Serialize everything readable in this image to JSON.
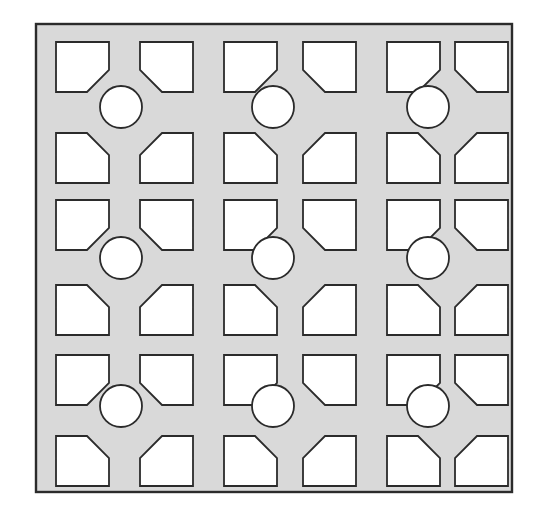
{
  "figure": {
    "name": "perforated-panel-pattern",
    "canvas": {
      "width": 548,
      "height": 516
    },
    "background_color": "#ffffff"
  },
  "panel": {
    "x": 36,
    "y": 24,
    "width": 476,
    "height": 468,
    "fill_color": "#d9d9d9",
    "stroke_color": "#2b2b2b",
    "stroke_width": 2.4
  },
  "holes": {
    "fill_color": "#ffffff",
    "stroke_color": "#2b2b2b",
    "stroke_width": 1.8,
    "square": {
      "count": 36,
      "rows": 6,
      "cols": 6,
      "width": 53,
      "height": 50,
      "chamfer": 22,
      "col_x": [
        56,
        140,
        224,
        303,
        387,
        455
      ],
      "row_y": [
        42,
        133,
        200,
        285,
        355,
        436
      ],
      "chamfer_map": [
        [
          "bottom-right",
          "bottom-left",
          "bottom-right",
          "bottom-left",
          "bottom-right",
          "bottom-left"
        ],
        [
          "top-right",
          "top-left",
          "top-right",
          "top-left",
          "top-right",
          "top-left"
        ],
        [
          "bottom-right",
          "bottom-left",
          "bottom-right",
          "bottom-left",
          "bottom-right",
          "bottom-left"
        ],
        [
          "top-right",
          "top-left",
          "top-right",
          "top-left",
          "top-right",
          "top-left"
        ],
        [
          "bottom-right",
          "bottom-left",
          "bottom-right",
          "bottom-left",
          "bottom-right",
          "bottom-left"
        ],
        [
          "top-right",
          "top-left",
          "top-right",
          "top-left",
          "top-right",
          "top-left"
        ]
      ]
    },
    "circle": {
      "count": 9,
      "rows": 3,
      "cols": 3,
      "radius": 21,
      "center_x": [
        121,
        273,
        428
      ],
      "center_y": [
        107,
        258,
        406
      ]
    }
  }
}
